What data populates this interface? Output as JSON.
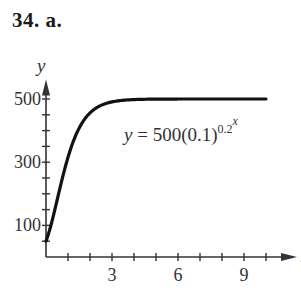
{
  "header": {
    "problem_label": "34. a."
  },
  "equation": {
    "lhs": "y",
    "equals": " = ",
    "rhs_base": "500(0.1)",
    "exponent_base": "0.2",
    "exponent_power": "x"
  },
  "colors": {
    "curve": "#111111",
    "axis": "#333333",
    "text": "#333333"
  },
  "chart_data": {
    "type": "line",
    "title": "",
    "xlabel": "x",
    "ylabel": "y",
    "xlim": [
      0,
      10.5
    ],
    "ylim": [
      0,
      530
    ],
    "x_ticks": [
      1,
      2,
      3,
      4,
      5,
      6,
      7,
      8,
      9,
      10
    ],
    "x_tick_labels": {
      "3": "3",
      "6": "6",
      "9": "9"
    },
    "y_ticks": [
      50,
      100,
      150,
      200,
      250,
      300,
      350,
      400,
      450,
      500
    ],
    "y_tick_labels": {
      "100": "100",
      "300": "300",
      "500": "500"
    },
    "grid": false,
    "annotation": "y = 500(0.1)^(0.2^x)",
    "series": [
      {
        "name": "y = 500(0.1)^(0.2^x)",
        "x": [
          0,
          0.5,
          1,
          1.5,
          2,
          2.5,
          3,
          4,
          5,
          6,
          7,
          8,
          9,
          10
        ],
        "y": [
          50,
          178,
          315,
          404,
          456,
          481,
          491,
          498,
          500,
          500,
          500,
          500,
          500,
          500
        ]
      }
    ]
  }
}
